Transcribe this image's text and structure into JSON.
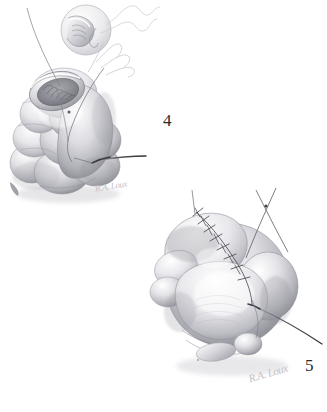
{
  "plate": {
    "medium": "graphite pencil drawing",
    "subject": "surgical closure technique, two-stage sequence",
    "background_color": "#ffffff",
    "width": 327,
    "height": 412
  },
  "figures": [
    {
      "number": "4",
      "title": "Figure 4",
      "description": "Lobed hollow organ with open lumen at the superior pole; suture thread passed through the everted wall edge, needle exiting laterally to the right. Inset magnification circle above shows the stitch bite detail.",
      "stage": "suture placement",
      "lumen_open": true,
      "needle_visible": true,
      "inset": {
        "present": true,
        "shape": "circle",
        "label": "detail of stitch bite through wall edge"
      }
    },
    {
      "number": "5",
      "title": "Figure 5",
      "description": "Same organ after closure; completed running suture line crosses the superior surface with regularly spaced stitches. Free thread ends cross above and a needle exits to the lower right.",
      "stage": "closure completed",
      "lumen_open": false,
      "needle_visible": true,
      "stitch_count": 8,
      "inset": {
        "present": false
      }
    }
  ],
  "labels": {
    "fig4_number": "4",
    "fig5_number": "5"
  },
  "signatures": {
    "fig4": "R.A. Loux",
    "fig5": "R.A. Loux"
  },
  "palette": {
    "paper": "#ffffff",
    "graphite_dark": "#3a3a3e",
    "graphite_mid": "#8d8d94",
    "graphite_light": "#c8c8cd",
    "thread": "#5a5a60",
    "thread_faint": "#cfcfd6",
    "number_ink": "#2a2a2a",
    "signature_ink": "#c2c2c6"
  }
}
